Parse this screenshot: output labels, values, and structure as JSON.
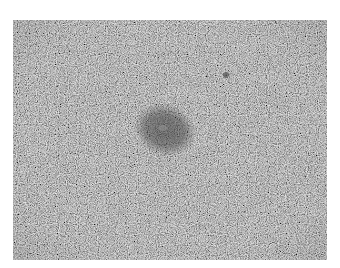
{
  "image": {
    "description": "Grayscale histology micrograph showing a densely cellular tissue with a darker, compact cluster of cells near the center",
    "colors": {
      "background": "#ffffff",
      "tissue_base": "#8a8a8a",
      "nuclei_dark": "#3a3a3a",
      "cluster_dark": "#4a4a4a",
      "stroma_light": "#b5b5b5"
    }
  }
}
